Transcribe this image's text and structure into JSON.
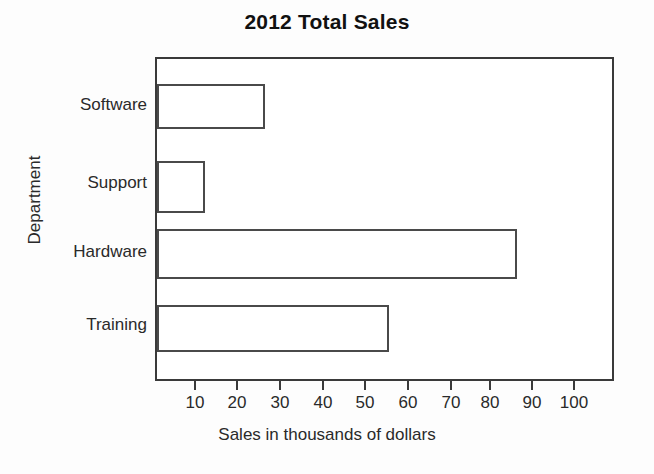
{
  "chart_data": {
    "type": "bar",
    "orientation": "horizontal",
    "title": "2012 Total Sales",
    "xlabel": "Sales in thousands of dollars",
    "ylabel": "Department",
    "categories": [
      "Software",
      "Support",
      "Hardware",
      "Training"
    ],
    "values": [
      25,
      11,
      85,
      55
    ],
    "xlim": [
      0,
      108
    ],
    "xticks": [
      10,
      20,
      30,
      40,
      50,
      60,
      70,
      80,
      90,
      100
    ],
    "xtick_labels": [
      "10",
      "20",
      "30",
      "40",
      "50",
      "60",
      "70",
      "80",
      "90",
      "100"
    ],
    "grid": false,
    "legend": false,
    "bar_style": {
      "fill": "#ffffff",
      "edge": "#4a4a4a"
    },
    "frame_color": "#3a3a3a",
    "background": "#ffffff"
  },
  "bars": [
    {
      "label": "Software",
      "value": 25,
      "top": 82,
      "height": 45,
      "width_px": 108
    },
    {
      "label": "Support",
      "value": 11,
      "top": 159,
      "height": 52,
      "width_px": 48
    },
    {
      "label": "Hardware",
      "value": 85,
      "top": 227,
      "height": 50,
      "width_px": 360
    },
    {
      "label": "Training",
      "value": 55,
      "top": 303,
      "height": 47,
      "width_px": 232
    }
  ],
  "xticks": [
    {
      "label": "10",
      "x": 194
    },
    {
      "label": "20",
      "x": 236
    },
    {
      "label": "30",
      "x": 279
    },
    {
      "label": "40",
      "x": 322
    },
    {
      "label": "50",
      "x": 364
    },
    {
      "label": "60",
      "x": 407
    },
    {
      "label": "70",
      "x": 450
    },
    {
      "label": "80",
      "x": 489
    },
    {
      "label": "90",
      "x": 531
    },
    {
      "label": "100",
      "x": 573
    }
  ]
}
